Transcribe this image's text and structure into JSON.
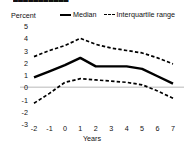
{
  "title_fragment": "▄▄▄▄▄▄▄▄▄▄▄",
  "legend": {
    "median_label": "Median",
    "iqr_label": "Interquartile range"
  },
  "axes": {
    "y_unit_label": "Percent",
    "x_title": "Years"
  },
  "colors": {
    "line": "#000000",
    "zero_gridline": "#d0d0d0",
    "text": "#111111",
    "background": "#ffffff"
  },
  "chart_data": {
    "type": "line",
    "title": "",
    "xlabel": "Years",
    "ylabel": "Percent",
    "x": [
      -2,
      -1,
      0,
      1,
      2,
      3,
      4,
      5,
      6,
      7
    ],
    "xticklabels": [
      "-2",
      "-1",
      "0",
      "1",
      "2",
      "3",
      "4",
      "5",
      "6",
      "7"
    ],
    "yticks": [
      5,
      4,
      3,
      2,
      1,
      0,
      -1,
      -2,
      -3
    ],
    "yticklabels": [
      "5",
      "4",
      "3",
      "2",
      "1",
      "0",
      "-1",
      "-2",
      "-3"
    ],
    "xlim": [
      -2,
      7
    ],
    "ylim": [
      -3,
      5
    ],
    "grid": false,
    "zero_line": true,
    "legend_position": "top",
    "series": [
      {
        "name": "Interquartile range",
        "role": "upper-quartile",
        "style": "dashed",
        "values": [
          2.5,
          3.0,
          3.4,
          4.0,
          3.5,
          3.2,
          3.0,
          2.8,
          2.4,
          1.9
        ]
      },
      {
        "name": "Median",
        "role": "median",
        "style": "solid",
        "values": [
          0.8,
          1.3,
          1.8,
          2.4,
          1.7,
          1.7,
          1.7,
          1.5,
          0.9,
          0.3
        ]
      },
      {
        "name": "Interquartile range",
        "role": "lower-quartile",
        "style": "dashed",
        "values": [
          -1.3,
          -0.5,
          0.4,
          0.7,
          0.6,
          0.5,
          0.4,
          0.2,
          -0.3,
          -0.9
        ]
      }
    ]
  }
}
